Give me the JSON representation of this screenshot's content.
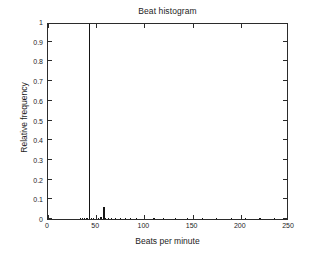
{
  "chart_data": {
    "type": "bar",
    "title": "Beat histogram",
    "xlabel": "Beats per minute",
    "ylabel": "Relative frequency",
    "xlim": [
      0,
      250
    ],
    "ylim": [
      0,
      1
    ],
    "grid": false,
    "legend": null,
    "xticks": [
      0,
      50,
      100,
      150,
      200,
      250
    ],
    "xticklabels": [
      "0",
      "50",
      "100",
      "150",
      "200",
      "250"
    ],
    "yticks": [
      0,
      0.1,
      0.2,
      0.3,
      0.4,
      0.5,
      0.6,
      0.7,
      0.8,
      0.9,
      1
    ],
    "yticklabels": [
      "0",
      "0.1",
      "0.2",
      "0.3",
      "0.4",
      "0.5",
      "0.6",
      "0.7",
      "0.8",
      "0.9",
      "1"
    ],
    "x": [
      34,
      36,
      38,
      40,
      41,
      43,
      45,
      47,
      50,
      52,
      55,
      58,
      60,
      63,
      66,
      70,
      75,
      80,
      86,
      92,
      100,
      110,
      120,
      132,
      145,
      160,
      175,
      190,
      205,
      220,
      235
    ],
    "values": [
      0.004,
      0.004,
      0.003,
      0.005,
      0.006,
      1.0,
      0.006,
      0.005,
      0.012,
      0.006,
      0.008,
      0.062,
      0.007,
      0.006,
      0.005,
      0.004,
      0.004,
      0.003,
      0.003,
      0.003,
      0.003,
      0.002,
      0.002,
      0.002,
      0.002,
      0.002,
      0.002,
      0.002,
      0.002,
      0.002,
      0.002
    ],
    "bar_color": "#151515",
    "peak_bpm": 43,
    "peak_value": 1.0,
    "secondary_peak_bpm": 58,
    "secondary_peak_value": 0.062
  },
  "figure": {
    "background_color": "#ffffff",
    "axis_color": "#2b2b2b"
  }
}
